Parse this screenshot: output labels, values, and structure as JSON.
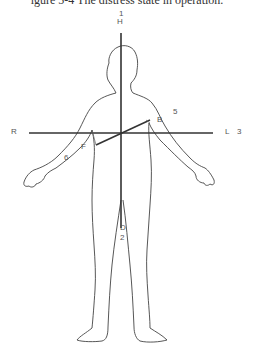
{
  "caption": "igure 5-4 The distress state in operation.",
  "labels": {
    "top_number": "1",
    "head": "H",
    "right": "R",
    "left": "L",
    "left_number": "3",
    "arm_right_number": "6",
    "arm_left_number": "5",
    "point_b": "B",
    "point_f": "F",
    "point_d": "D",
    "bottom_number": "2"
  },
  "colors": {
    "axis": "#333333",
    "outline": "#444444",
    "label": "#555555"
  }
}
